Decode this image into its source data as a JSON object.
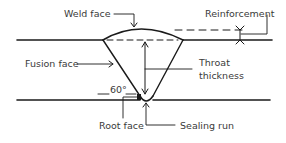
{
  "diagram": {
    "type": "weld-cross-section",
    "labels": {
      "weld_face": "Weld face",
      "reinforcement": "Reinforcement",
      "fusion_face": "Fusion face",
      "throat_line1": "Throat",
      "throat_line2": "thickness",
      "angle": "60°",
      "root_face": "Root face",
      "sealing_run": "Sealing run"
    },
    "colors": {
      "line": "#1a1a1a",
      "text": "#3a3a3a",
      "background": "#ffffff"
    }
  }
}
